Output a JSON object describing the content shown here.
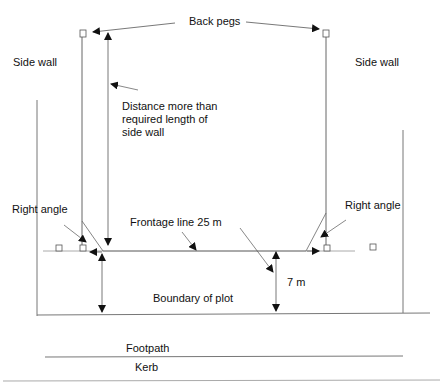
{
  "labels": {
    "back_pegs": "Back pegs",
    "side_wall_left": "Side wall",
    "side_wall_right": "Side wall",
    "distance_line1": "Distance more than",
    "distance_line2": "required length of",
    "distance_line3": "side wall",
    "right_angle_left": "Right angle",
    "right_angle_right": "Right angle",
    "frontage_line": "Frontage line 25 m",
    "seven_m": "7 m",
    "boundary": "Boundary of plot",
    "footpath": "Footpath",
    "kerb": "Kerb"
  },
  "colors": {
    "line": "#555555",
    "light_line": "#aaaaaa",
    "text": "#111111"
  }
}
